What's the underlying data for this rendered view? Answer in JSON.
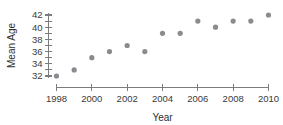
{
  "chart_data": {
    "type": "scatter",
    "title": "",
    "xlabel": "Year",
    "ylabel": "Mean Age",
    "x": [
      1998,
      1999,
      2000,
      2001,
      2002,
      2003,
      2004,
      2005,
      2006,
      2007,
      2008,
      2009,
      2010
    ],
    "values": [
      32,
      33,
      35,
      36,
      37,
      36,
      39,
      39,
      41,
      40,
      41,
      41,
      42
    ],
    "xlim": [
      1998,
      2010
    ],
    "ylim": [
      32,
      42
    ],
    "x_ticks": [
      1998,
      1999,
      2000,
      2001,
      2002,
      2003,
      2004,
      2005,
      2006,
      2007,
      2008,
      2009,
      2010
    ],
    "x_tick_labels": [
      "1998",
      "",
      "2000",
      "",
      "2002",
      "",
      "2004",
      "",
      "2006",
      "",
      "2008",
      "",
      "2010"
    ],
    "y_ticks": [
      32,
      33,
      34,
      35,
      36,
      37,
      38,
      39,
      40,
      41,
      42
    ],
    "y_tick_labels": [
      "32",
      "",
      "34",
      "",
      "36",
      "",
      "38",
      "",
      "40",
      "",
      "42"
    ],
    "grid": false,
    "legend": null,
    "marker_color": "#8a8a90",
    "axis_color": "#7c7c80",
    "marker_size": 2.6
  },
  "axes": {
    "x_title": "Year",
    "y_title": "Mean Age"
  }
}
